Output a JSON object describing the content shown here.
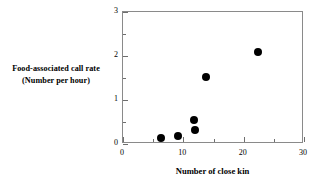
{
  "chart_data": {
    "type": "scatter",
    "title": "",
    "xlabel": "Number of close kin",
    "ylabel_lines": [
      "Food-associated call rate",
      "(Number per hour)"
    ],
    "ylabel": "Food-associated call rate (Number per hour)",
    "xlim": [
      0,
      30
    ],
    "ylim": [
      0,
      3
    ],
    "x_major_ticks": [
      0,
      10,
      20,
      30
    ],
    "x_minor_ticks": [
      5,
      15,
      25
    ],
    "y_major_ticks": [
      0,
      1,
      2,
      3
    ],
    "y_minor_ticks": [
      0.5,
      1.5,
      2.5
    ],
    "x_tick_labels": [
      "0",
      "10",
      "20",
      "30"
    ],
    "y_tick_labels": [
      "0",
      "1",
      "2",
      "3"
    ],
    "grid": false,
    "legend": false,
    "marker": "filled-circle",
    "marker_color": "#000000",
    "frame": "box",
    "frame_color": "#8a8a8a",
    "points": [
      {
        "x": 6.3,
        "y": 0.13
      },
      {
        "x": 9.1,
        "y": 0.19
      },
      {
        "x": 11.9,
        "y": 0.31
      },
      {
        "x": 11.8,
        "y": 0.54
      },
      {
        "x": 13.7,
        "y": 1.52
      },
      {
        "x": 22.3,
        "y": 2.08
      }
    ],
    "series": [
      {
        "name": "Food-associated call rate vs close kin",
        "x": [
          6.3,
          9.1,
          11.9,
          11.8,
          13.7,
          22.3
        ],
        "values": [
          0.13,
          0.19,
          0.31,
          0.54,
          1.52,
          2.08
        ]
      }
    ]
  },
  "axes": {
    "y_title_line1": "Food-associated call rate",
    "y_title_line2": "(Number per hour)",
    "x_title": "Number of close kin"
  },
  "colors": {
    "marker": "#000000",
    "axis": "#8a8a8a",
    "tick": "#6e6e6e",
    "background": "#ffffff",
    "text": "#000000"
  }
}
